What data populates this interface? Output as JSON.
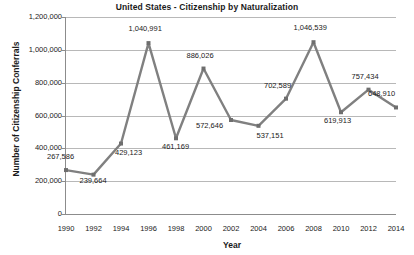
{
  "chart_data": {
    "type": "line",
    "title": "United States - Citizenship by Naturalization",
    "xlabel": "Year",
    "ylabel": "Number of Citizenship Conferrals",
    "categories": [
      1990,
      1992,
      1994,
      1996,
      1998,
      2000,
      2002,
      2004,
      2006,
      2008,
      2010,
      2012,
      2014
    ],
    "values": [
      267586,
      239664,
      429123,
      1040991,
      461169,
      886026,
      572646,
      537151,
      702589,
      1046539,
      619913,
      757434,
      648910
    ],
    "point_labels": [
      "267,586",
      "239,664",
      "429,123",
      "1,040,991",
      "461,169",
      "886,026",
      "572,646",
      "537,151",
      "702,589",
      "1,046,539",
      "619,913",
      "757,434",
      "648,910"
    ],
    "x_tick_labels": [
      "1990",
      "1992",
      "1994",
      "1996",
      "1998",
      "2000",
      "2002",
      "2004",
      "2006",
      "2008",
      "2010",
      "2012",
      "2014"
    ],
    "y_tick_labels": [
      "1,200,000",
      "1,000,000",
      "800,000",
      "600,000",
      "400,000",
      "200,000",
      "0"
    ],
    "y_tick_values": [
      1200000,
      1000000,
      800000,
      600000,
      400000,
      200000,
      0
    ],
    "ylim": [
      0,
      1200000
    ],
    "xlim": [
      1990,
      2014
    ],
    "grid": true,
    "legend": false,
    "series_color": "#808080",
    "grid_color": "#b8b8b8",
    "axis_color": "#8c8c8c",
    "text_color": "#1a1a1a",
    "marker": "square"
  }
}
